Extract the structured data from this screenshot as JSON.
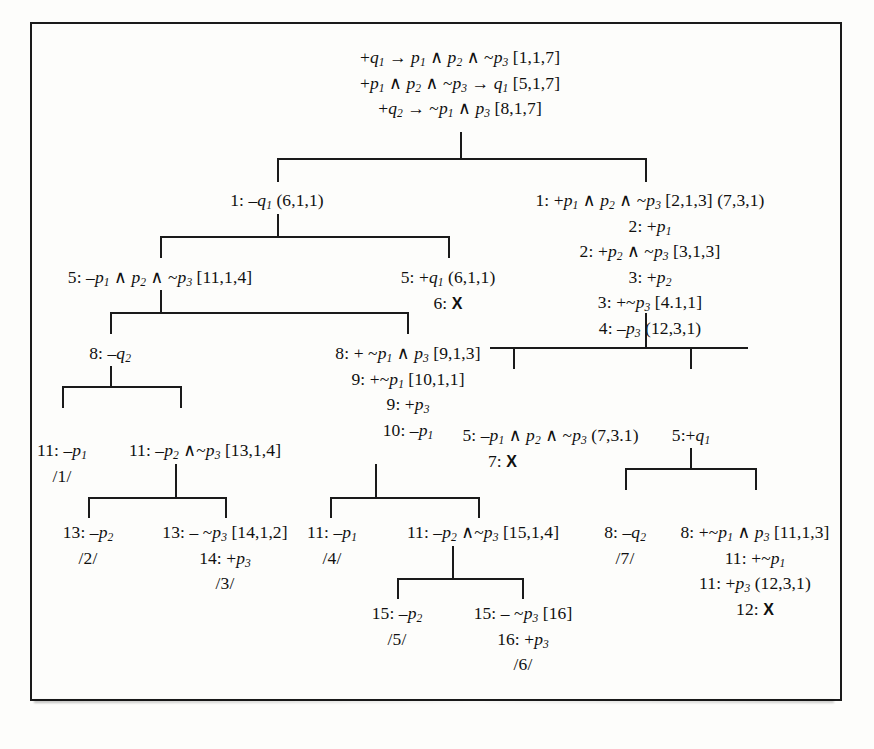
{
  "figure": {
    "type": "proof-tree",
    "frame": {
      "visible": true,
      "color": "#1a1a1a"
    }
  },
  "root": {
    "lines": [
      "+q₁ → p₁ ∧ p₂ ∧ ~p₃ [1,1,7]",
      "+p₁ ∧ p₂ ∧ ~p₃ → q₁ [5,1,7]",
      "+q₂ → ~p₁ ∧ p₃ [8,1,7]"
    ]
  },
  "nodes": {
    "n_left_1": {
      "lines": [
        "1: –q₁ (6,1,1)"
      ]
    },
    "n_right_1": {
      "lines": [
        "1: +p₁ ∧ p₂ ∧ ~p₃ [2,1,3] (7,3,1)",
        "2: +p₁",
        "2: +p₂ ∧ ~p₃ [3,1,3]",
        "3: +p₂",
        "3: +~p₃ [4.1,1]",
        "4: –p₃  (12,3,1)"
      ]
    },
    "n_5_left": {
      "lines": [
        "5: –p₁ ∧ p₂ ∧ ~p₃ [11,1,4]"
      ]
    },
    "n_5_right": {
      "lines": [
        "5: +q₁ (6,1,1)",
        "6:  X"
      ]
    },
    "n_8_q2": {
      "lines": [
        "8: –q₂"
      ]
    },
    "n_8_np1p3": {
      "lines": [
        "8: + ~p₁ ∧ p₃ [9,1,3]",
        "9: +~p₁ [10,1,1]",
        "9: +p₃",
        "10: –p₁"
      ]
    },
    "n_5_mid": {
      "lines": [
        "5: –p₁ ∧ p₂ ∧ ~p₃ (7,3.1)",
        "7: X"
      ]
    },
    "n_5_q1": {
      "lines": [
        "5:+q₁"
      ]
    },
    "n_11_p1": {
      "lines": [
        "11: –p₁",
        "/1/"
      ]
    },
    "n_11_p2p3": {
      "lines": [
        "11: –p₂ ∧~p₃ [13,1,4]"
      ]
    },
    "n_13_p2": {
      "lines": [
        "13: –p₂",
        "/2/"
      ]
    },
    "n_13_np3": {
      "lines": [
        "13: – ~p₃ [14,1,2]",
        "14: +p₃",
        "/3/"
      ]
    },
    "n_11_np1": {
      "lines": [
        "11: –p₁",
        "/4/"
      ]
    },
    "n_11_p2np3": {
      "lines": [
        "11: –p₂ ∧~p₃ [15,1,4]"
      ]
    },
    "n_15_p2": {
      "lines": [
        "15: –p₂",
        "/5/"
      ]
    },
    "n_15_np3": {
      "lines": [
        "15: – ~p₃ [16]",
        "16: +p₃",
        "/6/"
      ]
    },
    "n_8_q2_r": {
      "lines": [
        "8: –q₂",
        "/7/"
      ]
    },
    "n_8_np1p3_r": {
      "lines": [
        "8: +~p₁ ∧ p₃ [11,1,3]",
        "11: +~p₁",
        "11: +p₃ (12,3,1)",
        "12:  X"
      ]
    }
  }
}
